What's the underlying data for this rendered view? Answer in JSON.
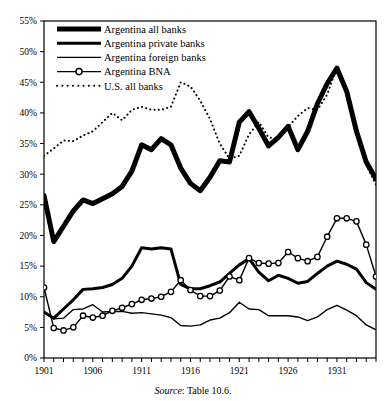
{
  "chart_data": {
    "type": "line",
    "title": "",
    "xlabel": "",
    "ylabel": "",
    "xlim": [
      1901,
      1935
    ],
    "ylim": [
      0,
      55
    ],
    "yunit": "%",
    "grid": false,
    "legend_position": "top-left",
    "ytick_labels": [
      "0%",
      "5%",
      "10%",
      "15%",
      "20%",
      "25%",
      "30%",
      "35%",
      "40%",
      "45%",
      "50%",
      "55%"
    ],
    "ytick_values": [
      0,
      5,
      10,
      15,
      20,
      25,
      30,
      35,
      40,
      45,
      50,
      55
    ],
    "xtick_labels": [
      "1901",
      "1906",
      "1911",
      "1916",
      "1921",
      "1926",
      "1931"
    ],
    "xtick_values": [
      1901,
      1906,
      1911,
      1916,
      1921,
      1926,
      1931
    ],
    "x": [
      1901,
      1902,
      1903,
      1904,
      1905,
      1906,
      1907,
      1908,
      1909,
      1910,
      1911,
      1912,
      1913,
      1914,
      1915,
      1916,
      1917,
      1918,
      1919,
      1920,
      1921,
      1922,
      1923,
      1924,
      1925,
      1926,
      1927,
      1928,
      1929,
      1930,
      1931,
      1932,
      1933,
      1934,
      1935
    ],
    "series": [
      {
        "name": "Argentina all banks",
        "style": "solid",
        "width": 5,
        "marker": "none",
        "color": "#000000",
        "values": [
          26.5,
          19.0,
          21.5,
          24.0,
          25.8,
          25.2,
          26.0,
          26.8,
          28.0,
          30.5,
          34.8,
          34.0,
          35.8,
          34.8,
          31.0,
          28.5,
          27.3,
          29.5,
          32.2,
          32.0,
          38.5,
          40.2,
          37.5,
          34.6,
          36.0,
          37.8,
          34.0,
          37.0,
          41.5,
          44.8,
          47.3,
          43.5,
          37.0,
          32.0,
          29.2
        ]
      },
      {
        "name": "Argentina private banks",
        "style": "solid",
        "width": 3,
        "marker": "none",
        "color": "#000000",
        "values": [
          7.5,
          6.5,
          8.0,
          9.5,
          11.2,
          11.3,
          11.5,
          12.0,
          13.0,
          15.0,
          18.0,
          17.8,
          18.0,
          17.8,
          12.0,
          11.3,
          11.3,
          11.8,
          12.4,
          13.8,
          15.2,
          16.2,
          14.0,
          12.6,
          13.5,
          13.0,
          12.2,
          12.5,
          13.8,
          15.0,
          15.8,
          15.3,
          14.5,
          12.3,
          11.2
        ]
      },
      {
        "name": "Argentina foreign banks",
        "style": "solid",
        "width": 1.4,
        "marker": "none",
        "color": "#000000",
        "values": [
          7.5,
          6.4,
          6.5,
          7.9,
          8.0,
          8.7,
          7.5,
          7.6,
          7.6,
          7.3,
          7.4,
          7.2,
          7.0,
          6.6,
          5.3,
          5.2,
          5.4,
          6.2,
          6.5,
          7.4,
          9.1,
          8.0,
          7.9,
          6.9,
          6.9,
          6.9,
          6.7,
          6.1,
          6.7,
          7.9,
          8.6,
          7.8,
          6.9,
          5.4,
          4.6
        ]
      },
      {
        "name": "Argentina BNA",
        "style": "solid",
        "width": 1.4,
        "marker": "circle",
        "color": "#000000",
        "values": [
          11.5,
          4.9,
          4.5,
          5.0,
          6.9,
          6.6,
          6.9,
          7.7,
          8.2,
          8.8,
          9.5,
          9.7,
          10.0,
          10.8,
          12.7,
          11.1,
          10.1,
          10.1,
          11.0,
          13.3,
          12.7,
          16.3,
          15.5,
          15.4,
          15.5,
          17.3,
          16.3,
          15.8,
          16.5,
          19.8,
          22.8,
          22.8,
          22.3,
          18.5,
          13.3
        ]
      },
      {
        "name": "U.S. all banks",
        "style": "dotted",
        "width": 2,
        "marker": "none",
        "color": "#000000",
        "values": [
          33.0,
          34.2,
          35.5,
          35.4,
          36.3,
          37.0,
          38.5,
          40.0,
          38.8,
          40.5,
          41.0,
          40.5,
          40.5,
          41.0,
          45.0,
          44.3,
          42.0,
          39.0,
          35.0,
          32.5,
          33.0,
          36.5,
          38.5,
          36.0,
          35.7,
          37.7,
          39.5,
          40.8,
          40.5,
          43.0,
          47.5,
          44.0,
          38.0,
          31.5,
          28.3
        ]
      }
    ]
  },
  "legend": {
    "items": [
      {
        "label": "Argentina all banks"
      },
      {
        "label": "Argentina private banks"
      },
      {
        "label": "Argentina foreign banks"
      },
      {
        "label": "Argentina BNA"
      },
      {
        "label": "U.S. all banks"
      }
    ]
  },
  "caption": {
    "source_word": "Source",
    "source_rest": ": Table 10.6."
  }
}
